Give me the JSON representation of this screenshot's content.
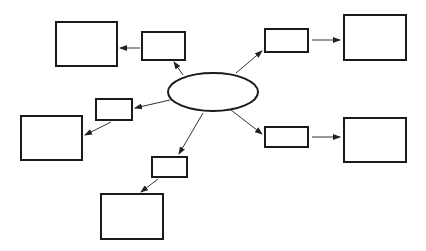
{
  "diagram": {
    "type": "mind-map",
    "stroke_color": "#1a1a1a",
    "arrow_color": "#333333",
    "background": "#ffffff",
    "center": {
      "cx": 213,
      "cy": 92,
      "rx": 45,
      "ry": 19,
      "label": ""
    },
    "branches": [
      {
        "name": "top-left",
        "small_box": {
          "x": 142,
          "y": 32,
          "w": 43,
          "h": 28,
          "label": ""
        },
        "large_box": {
          "x": 56,
          "y": 22,
          "w": 61,
          "h": 44,
          "label": ""
        },
        "arrow_center_to_small": {
          "x1": 183,
          "y1": 75,
          "x2": 174,
          "y2": 62
        },
        "arrow_small_to_large": {
          "x1": 140,
          "y1": 48,
          "x2": 120,
          "y2": 48
        }
      },
      {
        "name": "left",
        "small_box": {
          "x": 96,
          "y": 99,
          "w": 36,
          "h": 21,
          "label": ""
        },
        "large_box": {
          "x": 21,
          "y": 116,
          "w": 61,
          "h": 44,
          "label": ""
        },
        "arrow_center_to_small": {
          "x1": 170,
          "y1": 100,
          "x2": 135,
          "y2": 108
        },
        "arrow_small_to_large": {
          "x1": 111,
          "y1": 122,
          "x2": 85,
          "y2": 135
        }
      },
      {
        "name": "bottom",
        "small_box": {
          "x": 152,
          "y": 157,
          "w": 35,
          "h": 20,
          "label": ""
        },
        "large_box": {
          "x": 101,
          "y": 194,
          "w": 62,
          "h": 45,
          "label": ""
        },
        "arrow_center_to_small": {
          "x1": 203,
          "y1": 113,
          "x2": 179,
          "y2": 154
        },
        "arrow_small_to_large": {
          "x1": 158,
          "y1": 179,
          "x2": 141,
          "y2": 192
        }
      },
      {
        "name": "top-right",
        "small_box": {
          "x": 265,
          "y": 29,
          "w": 43,
          "h": 23,
          "label": ""
        },
        "large_box": {
          "x": 344,
          "y": 15,
          "w": 62,
          "h": 45,
          "label": ""
        },
        "arrow_center_to_small": {
          "x1": 236,
          "y1": 73,
          "x2": 262,
          "y2": 51
        },
        "arrow_small_to_large": {
          "x1": 312,
          "y1": 40,
          "x2": 340,
          "y2": 40
        }
      },
      {
        "name": "bottom-right",
        "small_box": {
          "x": 265,
          "y": 127,
          "w": 43,
          "h": 20,
          "label": ""
        },
        "large_box": {
          "x": 344,
          "y": 118,
          "w": 62,
          "h": 44,
          "label": ""
        },
        "arrow_center_to_small": {
          "x1": 231,
          "y1": 110,
          "x2": 262,
          "y2": 134
        },
        "arrow_small_to_large": {
          "x1": 312,
          "y1": 137,
          "x2": 340,
          "y2": 137
        }
      }
    ]
  }
}
